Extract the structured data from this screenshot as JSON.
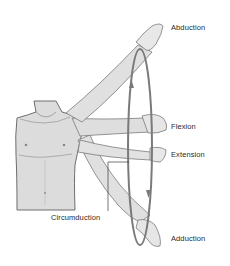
{
  "figure": {
    "colors": {
      "skin_fill": "#d9d9d9",
      "outline": "#6e6e6e",
      "ring": "#7a7a7a",
      "label_text": "#2a2a2a",
      "background": "#ffffff"
    }
  },
  "labels": {
    "abduction": "Abduction",
    "flexion": "Flexion",
    "extension": "Extension",
    "circumduction": "Circumduction",
    "adduction": "Adduction"
  }
}
